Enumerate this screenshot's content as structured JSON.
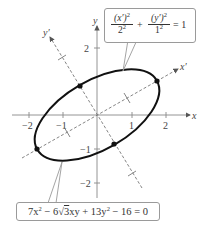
{
  "diagram": {
    "type": "rotated-ellipse-graph",
    "axes": {
      "x_label": "x",
      "y_label": "y",
      "x_ticks": [
        {
          "value": -2,
          "label": "−2"
        },
        {
          "value": -1,
          "label": "−1"
        },
        {
          "value": 1,
          "label": "1"
        },
        {
          "value": 2,
          "label": "2"
        }
      ],
      "y_ticks": [
        {
          "value": 2,
          "label": "2"
        },
        {
          "value": -1,
          "label": "−1"
        },
        {
          "value": -2,
          "label": "−2"
        }
      ]
    },
    "rotated_axes": {
      "x_prime_label": "x′",
      "y_prime_label": "y′",
      "rotation_degrees": 30
    },
    "ellipse": {
      "semi_major": 2,
      "semi_minor": 1,
      "marked_points": [
        {
          "x": 1.732,
          "y": 1
        },
        {
          "x": -1.732,
          "y": -1
        },
        {
          "x": -0.5,
          "y": 0.866
        },
        {
          "x": 0.5,
          "y": -0.866
        }
      ]
    },
    "callouts": {
      "standard_form": {
        "num1": "(x′)",
        "num1_exp": "2",
        "den1": "2",
        "den1_exp": "2",
        "plus": "+",
        "num2": "(y′)",
        "num2_exp": "2",
        "den2": "1",
        "den2_exp": "2",
        "rhs": "= 1"
      },
      "general_form": {
        "part1": "7x",
        "exp1": "2",
        "part2": " − 6",
        "sqrt_sign": "√",
        "radicand": "3",
        "part3": "xy + 13y",
        "exp2": "2",
        "part4": " − 16 = 0"
      }
    }
  }
}
